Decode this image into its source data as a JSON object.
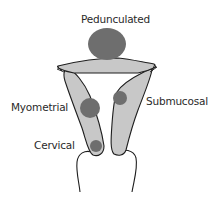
{
  "diagram": {
    "labels": {
      "pedunculated": "Pedunculated",
      "myometrial": "Myometrial",
      "submucosal": "Submucosal",
      "cervical": "Cervical"
    },
    "colors": {
      "tissue_fill": "#c8c8c8",
      "fibroid_fill": "#6e6e6e",
      "outline": "#1e1e1e",
      "text": "#2a2a2a"
    }
  }
}
